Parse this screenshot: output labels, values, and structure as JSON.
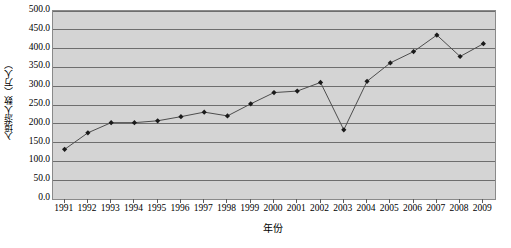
{
  "chart_data": {
    "type": "line",
    "title": "",
    "xlabel": "年份",
    "ylabel": "入境游人数（万人）",
    "categories": [
      "1991",
      "1992",
      "1993",
      "1994",
      "1995",
      "1996",
      "1997",
      "1998",
      "1999",
      "2000",
      "2001",
      "2002",
      "2003",
      "2004",
      "2005",
      "2006",
      "2007",
      "2008",
      "2009"
    ],
    "values": [
      132.0,
      176.0,
      203.0,
      203.0,
      208.0,
      219.0,
      231.0,
      221.0,
      253.0,
      283.0,
      287.0,
      310.0,
      184.0,
      313.0,
      362.0,
      392.0,
      436.0,
      379.0,
      413.0
    ],
    "ylim": [
      0.0,
      500.0
    ],
    "ytick_step": 50.0,
    "ytick_labels": [
      "0.0",
      "50.0",
      "100.0",
      "150.0",
      "200.0",
      "250.0",
      "300.0",
      "350.0",
      "400.0",
      "450.0",
      "500.0"
    ],
    "grid": true,
    "legend": "none",
    "series_name": "入境游人数",
    "marker": "filled-diamond",
    "colors": {
      "plot_background": "#d4d4d4",
      "page_background": "#ffffff",
      "gridline": "#6e6e6e",
      "plot_border": "#8a8a8a",
      "line": "#4d4d4d",
      "marker": "#1a1a1a",
      "text": "#000000"
    }
  }
}
